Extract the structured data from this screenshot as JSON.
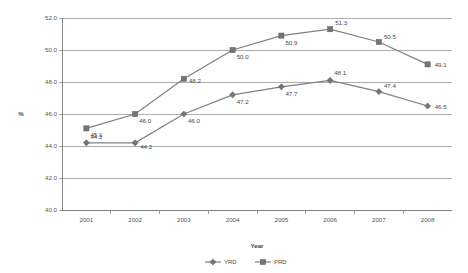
{
  "chart_data": {
    "type": "line",
    "title": "",
    "xlabel": "Year",
    "ylabel": "%",
    "categories": [
      "2001",
      "2002",
      "2003",
      "2004",
      "2005",
      "2006",
      "2007",
      "2008"
    ],
    "x": [
      2001,
      2002,
      2003,
      2004,
      2005,
      2006,
      2007,
      2008
    ],
    "ylim": [
      40.0,
      52.0
    ],
    "ytick_labels": [
      "52.0",
      "50.0",
      "48.0",
      "46.0",
      "44.0",
      "42.0",
      "40.0"
    ],
    "ytick_values": [
      52.0,
      50.0,
      48.0,
      46.0,
      44.0,
      42.0,
      40.0
    ],
    "ystep": 2.0,
    "grid": true,
    "legend_position": "bottom",
    "series": [
      {
        "name": "YRD",
        "marker": "diamond",
        "color": "#808080",
        "values": [
          44.2,
          44.2,
          46.0,
          47.2,
          47.7,
          48.1,
          47.4,
          46.5
        ],
        "labels": [
          "44.2",
          "44.2",
          "46.0",
          "47.2",
          "47.7",
          "48.1",
          "47.4",
          "46.5"
        ]
      },
      {
        "name": "PRD",
        "marker": "square",
        "color": "#757575",
        "values": [
          45.1,
          46.0,
          48.2,
          50.0,
          50.9,
          51.3,
          50.5,
          49.1
        ],
        "labels": [
          "45.1",
          "46.0",
          "48.2",
          "50.0",
          "50.9",
          "51.3",
          "50.5",
          "49.1"
        ]
      }
    ]
  },
  "legend": {
    "items": [
      {
        "label": "YRD"
      },
      {
        "label": "PRD"
      }
    ]
  }
}
